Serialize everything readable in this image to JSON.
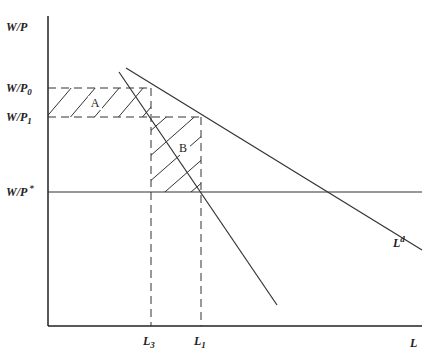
{
  "diagram": {
    "y_axis_label": "W/P",
    "x_axis_label": "L",
    "wage_levels": [
      {
        "id": "wp0",
        "base": "W/P",
        "sub": "0"
      },
      {
        "id": "wp1",
        "base": "W/P",
        "sub": "1"
      },
      {
        "id": "wpstar",
        "base": "W/P",
        "sup": "*"
      }
    ],
    "employment_levels": [
      {
        "id": "l3",
        "base": "L",
        "sub": "3"
      },
      {
        "id": "l1",
        "base": "L",
        "sub": "1"
      }
    ],
    "curves": [
      {
        "id": "labor-demand",
        "label_base": "L",
        "label_sup": "d"
      },
      {
        "id": "steep-demand",
        "label_base": ""
      }
    ],
    "areas": [
      {
        "id": "area-a",
        "label": "A"
      },
      {
        "id": "area-b",
        "label": "B"
      }
    ]
  }
}
